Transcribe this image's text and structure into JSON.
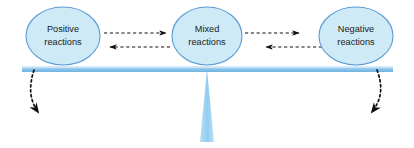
{
  "diagram": {
    "type": "balance-seesaw-diagram",
    "background_color": "#ffffff",
    "nodes": [
      {
        "id": "positive",
        "label_line1": "Positive",
        "label_line2": "reactions",
        "cx": 63,
        "cy": 36,
        "rx": 37,
        "ry": 29,
        "fill": "#cfeaf7",
        "stroke": "#5b9bd5"
      },
      {
        "id": "mixed",
        "label_line1": "Mixed",
        "label_line2": "reactions",
        "cx": 207,
        "cy": 36,
        "rx": 35,
        "ry": 29,
        "fill": "#cfeaf7",
        "stroke": "#5b9bd5"
      },
      {
        "id": "negative",
        "label_line1": "Negative",
        "label_line2": "reactions",
        "cx": 356,
        "cy": 36,
        "rx": 37,
        "ry": 29,
        "fill": "#cfeaf7",
        "stroke": "#5b9bd5"
      }
    ],
    "beam": {
      "color": "#7fbce8",
      "highlight_color": "#a9d5f2",
      "x1": 22,
      "x2": 393,
      "y": 69,
      "thickness": 6
    },
    "fulcrum": {
      "color": "#9fd1f2",
      "apex_x": 207,
      "apex_y": 69,
      "base_y": 142,
      "base_half_width": 7
    },
    "connectors": [
      {
        "id": "positive-to-mixed",
        "direction": "right",
        "style": "dashed",
        "color": "#111111"
      },
      {
        "id": "mixed-to-positive",
        "direction": "left",
        "style": "dashed",
        "color": "#111111"
      },
      {
        "id": "mixed-to-negative",
        "direction": "right",
        "style": "dashed",
        "color": "#111111"
      },
      {
        "id": "negative-to-mixed",
        "direction": "left",
        "style": "dashed",
        "color": "#111111"
      }
    ],
    "outflows": [
      {
        "id": "left-outflow",
        "direction": "down-left",
        "style": "dashed-curved",
        "color": "#111111"
      },
      {
        "id": "right-outflow",
        "direction": "down-right",
        "style": "dashed-curved",
        "color": "#111111"
      }
    ]
  }
}
